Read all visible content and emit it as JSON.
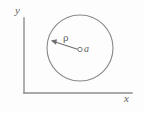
{
  "figure": {
    "type": "geometry-diagram",
    "background_color": "#fdfdfd",
    "line_color": "#8a8a8a",
    "label_color": "#5f5f5f"
  },
  "axes": {
    "x_label": "x",
    "y_label": "y",
    "origin": {
      "x": 24,
      "y": 93
    },
    "x_axis_end": {
      "x": 132,
      "y": 93
    },
    "y_axis_end": {
      "x": 24,
      "y": 18
    }
  },
  "shapes": {
    "circle": {
      "name": "main-circle",
      "center": {
        "x": 80,
        "y": 48
      },
      "radius": 33
    },
    "center_point": {
      "name": "center-marker",
      "label": "a",
      "x": 80,
      "y": 50,
      "radius": 2.2
    },
    "radius_arrow": {
      "name": "radius-arrow",
      "label": "ρ",
      "from": {
        "x": 77,
        "y": 49
      },
      "to": {
        "x": 52,
        "y": 41
      }
    }
  },
  "labels": {
    "rho": "ρ",
    "a": "a",
    "x": "x",
    "y": "y"
  }
}
